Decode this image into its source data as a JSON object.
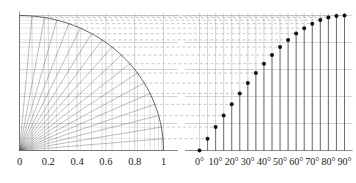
{
  "figure": {
    "name": "sine-construction-diagram",
    "background": "#ffffff",
    "ink": "#1a1a1a",
    "grid_color": "#b9b9b9",
    "dash_color": "#b0b0b0",
    "ray_color": "#555555",
    "arc_color": "#555555",
    "marker_color": "#111111",
    "stem_color": "#555555"
  },
  "left_panel": {
    "name": "unit-quarter-circle",
    "x_axis": {
      "label": "",
      "ticks": [
        0,
        0.2,
        0.4,
        0.6,
        0.8,
        1
      ],
      "tick_labels": [
        "0",
        "0.2",
        "0.4",
        "0.6",
        "0.8",
        "1"
      ],
      "range": [
        0,
        1.08
      ]
    },
    "y_axis": {
      "label": "",
      "ticks": [
        0,
        0.2,
        0.4,
        0.6,
        0.8,
        1
      ],
      "tick_labels": [
        "",
        "",
        "",
        "",
        "",
        ""
      ],
      "range": [
        0,
        1.05
      ]
    },
    "radius": 1,
    "ray_angles_deg": [
      0,
      5,
      10,
      15,
      20,
      25,
      30,
      35,
      40,
      45,
      50,
      55,
      60,
      65,
      70,
      75,
      80,
      85,
      90
    ]
  },
  "right_panel": {
    "name": "sine-curve-stem-plot",
    "x_axis": {
      "ticks_deg": [
        0,
        5,
        10,
        15,
        20,
        25,
        30,
        35,
        40,
        45,
        50,
        55,
        60,
        65,
        70,
        75,
        80,
        85,
        90
      ],
      "labeled_ticks_deg": [
        0,
        10,
        20,
        30,
        40,
        50,
        60,
        70,
        80,
        90
      ],
      "tick_labels": [
        "0°",
        "10°",
        "20°",
        "30°",
        "40°",
        "50°",
        "60°",
        "70°",
        "80°",
        "90°"
      ],
      "range_deg": [
        -10,
        95
      ]
    },
    "y_axis": {
      "ticks": [
        0,
        0.2,
        0.4,
        0.6,
        0.8,
        1
      ],
      "tick_labels": [
        "",
        "",
        "",
        "",
        "",
        ""
      ],
      "range": [
        0,
        1.05
      ]
    }
  },
  "chart_data": {
    "type": "line",
    "title": "",
    "subtitle": "",
    "xlabel": "",
    "ylabel": "",
    "grid": true,
    "legend": "none",
    "xlim_deg": [
      0,
      90
    ],
    "ylim": [
      0,
      1
    ],
    "x_deg": [
      0,
      5,
      10,
      15,
      20,
      25,
      30,
      35,
      40,
      45,
      50,
      55,
      60,
      65,
      70,
      75,
      80,
      85,
      90
    ],
    "values": [
      0.0,
      0.0872,
      0.1736,
      0.2588,
      0.342,
      0.4226,
      0.5,
      0.5736,
      0.6428,
      0.7071,
      0.766,
      0.8192,
      0.866,
      0.9063,
      0.9397,
      0.9659,
      0.9848,
      0.9962,
      1.0
    ],
    "series": [
      {
        "name": "sin",
        "values": [
          0.0,
          0.0872,
          0.1736,
          0.2588,
          0.342,
          0.4226,
          0.5,
          0.5736,
          0.6428,
          0.7071,
          0.766,
          0.8192,
          0.866,
          0.9063,
          0.9397,
          0.9659,
          0.9848,
          0.9962,
          1.0
        ]
      }
    ],
    "annotations": [
      "unit quarter circle with radial rays every 5 degrees",
      "dashed horizontal projection lines from circle to sine markers",
      "vertical stems from each marker down to the baseline"
    ]
  }
}
